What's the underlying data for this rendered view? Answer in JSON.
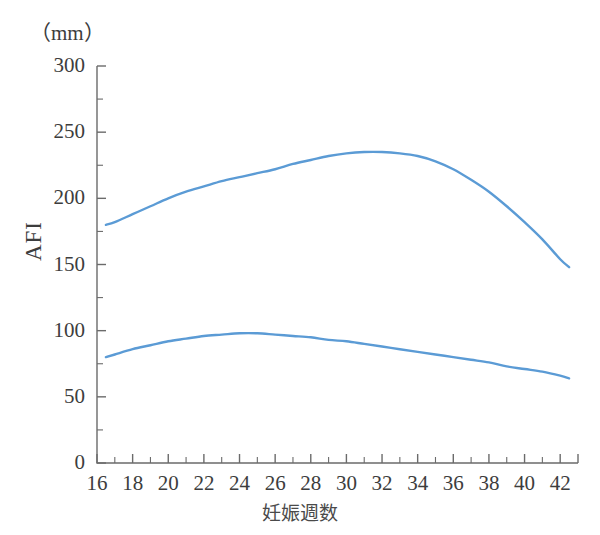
{
  "chart_data": {
    "type": "line",
    "title": "",
    "subtitle": "",
    "xlabel": "妊娠週数",
    "ylabel": "AFI",
    "unit_label": "（mm）",
    "xlim": [
      16,
      43
    ],
    "ylim": [
      0,
      300
    ],
    "grid": false,
    "legend": null,
    "x_major_ticks": [
      16,
      18,
      20,
      22,
      24,
      26,
      28,
      30,
      32,
      34,
      36,
      38,
      40,
      42
    ],
    "x_minor_ticks": [
      17,
      19,
      21,
      23,
      25,
      27,
      29,
      31,
      33,
      35,
      37,
      39,
      41
    ],
    "x_tick_labels": [
      "16",
      "18",
      "20",
      "22",
      "24",
      "26",
      "28",
      "30",
      "32",
      "34",
      "36",
      "38",
      "40",
      "42"
    ],
    "y_major_ticks": [
      0,
      50,
      100,
      150,
      200,
      250,
      300
    ],
    "y_minor_ticks": [
      25,
      75,
      125,
      175,
      225,
      275
    ],
    "y_tick_labels": [
      "0",
      "50",
      "100",
      "150",
      "200",
      "250",
      "300"
    ],
    "line_color": "#5b9bd5",
    "axis_color": "#6b6b6b",
    "x": [
      16.5,
      17,
      18,
      19,
      20,
      21,
      22,
      23,
      24,
      25,
      26,
      27,
      28,
      29,
      30,
      31,
      32,
      33,
      34,
      35,
      36,
      37,
      38,
      39,
      40,
      41,
      42,
      42.5
    ],
    "series": [
      {
        "name": "AFI upper limit (95th percentile)",
        "values": [
          180,
          182,
          188,
          194,
          200,
          205,
          209,
          213,
          216,
          219,
          222,
          226,
          229,
          232,
          234,
          235,
          235,
          234,
          232,
          228,
          222,
          214,
          205,
          194,
          182,
          169,
          154,
          148
        ]
      },
      {
        "name": "AFI lower limit (5th percentile)",
        "values": [
          80,
          82,
          86,
          89,
          92,
          94,
          96,
          97,
          98,
          98,
          97,
          96,
          95,
          93,
          92,
          90,
          88,
          86,
          84,
          82,
          80,
          78,
          76,
          73,
          71,
          69,
          66,
          64
        ]
      }
    ]
  }
}
